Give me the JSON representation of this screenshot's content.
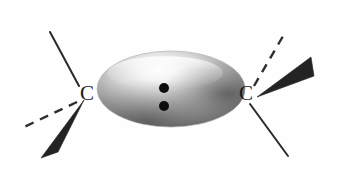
{
  "figure": {
    "background_color": "#fefefe",
    "width": 342,
    "height": 174
  },
  "atoms": [
    {
      "id": "carbon-left",
      "label": "C",
      "x": 87,
      "y": 95
    },
    {
      "id": "carbon-right",
      "label": "C",
      "x": 246,
      "y": 95
    }
  ],
  "orbital": {
    "name": "pi-electron-cloud",
    "shape": "ellipse",
    "center_x": 171,
    "center_y": 89,
    "radius_x": 74,
    "radius_y": 38,
    "highlight_color": "#fbfbfb",
    "mid_color": "#a8a8a8",
    "edge_color": "#5e5e5e",
    "outline_color": "#b9b9b9"
  },
  "electrons": {
    "name": "pi-electron-pair",
    "count": 2,
    "color": "#0d0d0d",
    "radius": 5,
    "positions": [
      {
        "x": 164,
        "y": 88
      },
      {
        "x": 164,
        "y": 106
      }
    ]
  },
  "bonds": [
    {
      "id": "bond-left-plain-up",
      "type": "plain",
      "atom": "carbon-left",
      "direction": "up-left",
      "x1": 79,
      "y1": 86,
      "x2": 50,
      "y2": 32,
      "color": "#2a2a2a"
    },
    {
      "id": "bond-left-dashed-down",
      "type": "dashed",
      "atom": "carbon-left",
      "direction": "down-left",
      "x1": 77,
      "y1": 102,
      "x2": 22,
      "y2": 128,
      "color": "#2e2e2e",
      "dash_count": 4
    },
    {
      "id": "bond-left-wedge-down",
      "type": "wedge",
      "atom": "carbon-left",
      "direction": "down-left",
      "tip_x": 84,
      "tip_y": 100,
      "base_left_x": 41,
      "base_left_y": 158,
      "base_right_x": 58,
      "base_right_y": 152,
      "color": "#232323"
    },
    {
      "id": "bond-right-dashed-up",
      "type": "dashed",
      "atom": "carbon-right",
      "direction": "up-right",
      "x1": 254,
      "y1": 86,
      "x2": 286,
      "y2": 31,
      "color": "#2e2e2e",
      "dash_count": 4
    },
    {
      "id": "bond-right-wedge-up",
      "type": "wedge",
      "atom": "carbon-right",
      "direction": "right-up",
      "tip_x": 257,
      "tip_y": 97,
      "base_left_x": 311,
      "base_left_y": 57,
      "base_right_x": 314,
      "base_right_y": 76,
      "color": "#232323"
    },
    {
      "id": "bond-right-plain-down",
      "type": "plain",
      "atom": "carbon-right",
      "direction": "down-right",
      "x1": 250,
      "y1": 104,
      "x2": 288,
      "y2": 156,
      "color": "#2a2a2a"
    }
  ]
}
